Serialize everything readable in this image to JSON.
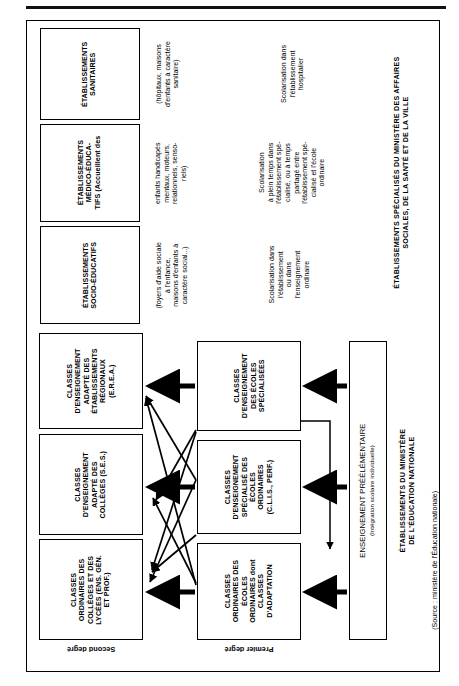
{
  "figure": {
    "orientation": "rotated-90-ccw",
    "top_rule": true,
    "source_note": "(Source : ministère de l'Éducation nationale)"
  },
  "specialised_section": {
    "title_line1": "ÉTABLISSEMENTS SPÉCIALISÉS DU MINISTÈRE DES AFFAIRES",
    "title_line2": "SOCIALES, DE LA SANTÉ ET DE LA VILLE",
    "boxes": [
      {
        "id": "etablissements-sanitaires",
        "heading": [
          "ÉTABLISSEMENTS",
          "SANITAIRES"
        ],
        "detail": [
          "(hôpitaux, maisons",
          "d'enfants à caractère",
          "sanitaire)"
        ],
        "schooling": [
          "Scolarisation dans",
          "l'établissement",
          "hospitalier"
        ]
      },
      {
        "id": "etablissements-medico-educatifs",
        "heading": [
          "ÉTABLISSEMENTS",
          "MÉDICO-ÉDUCA-",
          "TIFS (Accueillent des"
        ],
        "detail": [
          "enfants handicapés",
          "mentaux, moteurs,",
          "relationnels, senso-",
          "riels)"
        ],
        "schooling": [
          "Scolarisation",
          "à plein temps dans",
          "l'établissement spé-",
          "cialisé, ou à temps",
          "partagé entre",
          "l'établissement spé-",
          "cialisé et l'école",
          "ordinaire"
        ]
      },
      {
        "id": "etablissements-socio-educatifs",
        "heading": [
          "ÉTABLISSEMENTS",
          "SOCIO-ÉDUCATIFS"
        ],
        "detail": [
          "(foyers d'aide sociale",
          "à l'enfance,",
          "maisons d'enfants à",
          "caractère social...)"
        ],
        "schooling": [
          "Scolarisation dans",
          "l'établissement",
          "ou dans",
          "l'enseignement",
          "ordinaire"
        ]
      }
    ]
  },
  "education_nationale_section": {
    "title_line1": "ÉTABLISSEMENTS DU  MINISTÈRE",
    "title_line2": "DE L'ÉDUCATION NATIONALE",
    "preelementaire": {
      "label": "ENSEIGNEMENT PRÉÉLÉMENTAIRE",
      "sublabel": "(Intégration scolaire individuelle)"
    },
    "degree_labels": {
      "second": "Second degré",
      "premier": "Premier degré"
    },
    "second_degre_boxes": [
      {
        "id": "classes-enseignement-adapte-erea",
        "lines": [
          "CLASSES",
          "D'ENSEIGNEMENT",
          "ADAPTÉ DES",
          "ÉTABLISSEMENTS",
          "RÉGIONAUX",
          "(E.R.E.A.)"
        ]
      },
      {
        "id": "classes-enseignement-adapte-ses",
        "lines": [
          "CLASSES",
          "D'ENSEIGNEMENT",
          "ADAPTÉ DES",
          "COLLÈGES (S.E.S.)"
        ]
      },
      {
        "id": "classes-ordinaires-colleges-lycees",
        "lines": [
          "CLASSES",
          "ORDINAIRES DES",
          "COLLÈGES ET  DES",
          "LYCÉES (ENS. GÉN.",
          "ET PROF.)"
        ]
      }
    ],
    "premier_degre_boxes": [
      {
        "id": "classes-enseignement-ecoles-specialisees",
        "lines": [
          "CLASSES",
          "D'ENSEIGNEMENT",
          "DES ÉCOLES",
          "SPÉCIALISÉES"
        ]
      },
      {
        "id": "classes-enseignement-specialise-ecoles-ordinaires",
        "lines": [
          "CLASSES",
          "D'ENSEIGNEMENT",
          "SPÉCIALISÉ DES",
          "ÉCOLES",
          "ORDINAIRES",
          "(C.L.I.S., PERF.)"
        ]
      },
      {
        "id": "classes-ordinaires-ecoles-ordinaires-adaptation",
        "lines": [
          "CLASSES",
          "ORDINAIRES DES",
          "ÉCOLES",
          "ORDINAIRES dont",
          "CLASSES",
          "D'ADAPTATION"
        ]
      }
    ]
  }
}
